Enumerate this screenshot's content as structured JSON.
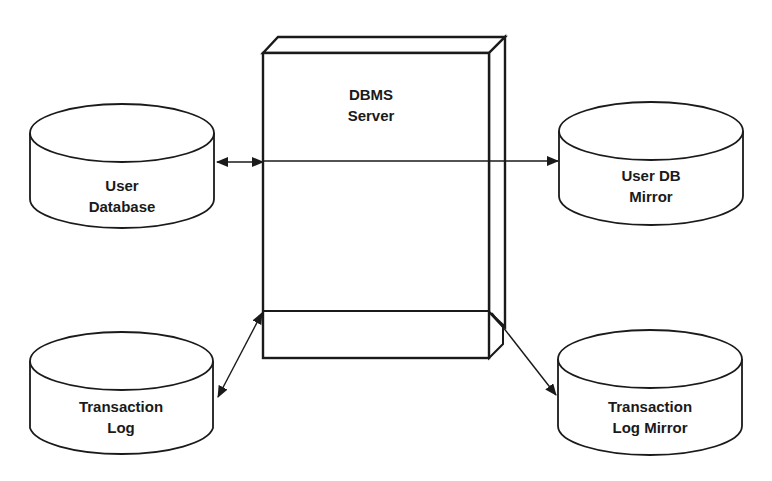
{
  "diagram": {
    "type": "system-architecture",
    "server": {
      "id": "dbms-server",
      "shape": "3d-box",
      "label_line1": "DBMS",
      "label_line2": "Server"
    },
    "databases": [
      {
        "id": "user-database",
        "shape": "cylinder",
        "label_line1": "User",
        "label_line2": "Database"
      },
      {
        "id": "user-db-mirror",
        "shape": "cylinder",
        "label_line1": "User DB",
        "label_line2": "Mirror"
      },
      {
        "id": "transaction-log",
        "shape": "cylinder",
        "label_line1": "Transaction",
        "label_line2": "Log"
      },
      {
        "id": "transaction-log-mirror",
        "shape": "cylinder",
        "label_line1": "Transaction",
        "label_line2": "Log Mirror"
      }
    ],
    "connections": [
      {
        "from": "user-database",
        "to": "dbms-server",
        "direction": "bidirectional"
      },
      {
        "from": "dbms-server",
        "to": "user-db-mirror",
        "direction": "one-way"
      },
      {
        "from": "transaction-log",
        "to": "dbms-server",
        "direction": "bidirectional"
      },
      {
        "from": "dbms-server",
        "to": "transaction-log-mirror",
        "direction": "one-way"
      }
    ],
    "colors": {
      "line": "#1a1a1a",
      "background": "#ffffff"
    }
  }
}
